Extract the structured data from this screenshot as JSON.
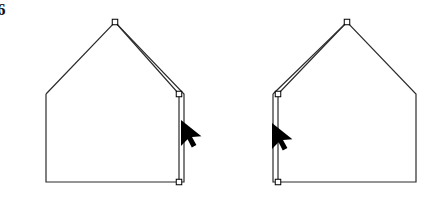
{
  "figure": {
    "corner_label": "6",
    "background_color": "#ffffff",
    "stroke_color": "#2b2b2b",
    "handle_fill": "#ffffff",
    "handle_stroke": "#000000",
    "cursor_color": "#000000",
    "width": 445,
    "height": 206
  },
  "shapes": {
    "left_house": {
      "name": "left-house-polygon",
      "outline_points": "46,94 46,182 184,182 184,94 115,22 46,94",
      "apex": {
        "x": 115,
        "y": 22
      },
      "left_eave": {
        "x": 46,
        "y": 94
      },
      "right_eave": {
        "x": 184,
        "y": 94
      },
      "bottom_left": {
        "x": 46,
        "y": 182
      },
      "bottom_right": {
        "x": 184,
        "y": 182
      },
      "dragged_edge_points": "115,22 179,94 179,182",
      "handles": [
        {
          "name": "vertex-handle-apex",
          "x": 115,
          "y": 22
        },
        {
          "name": "vertex-handle-right-eave",
          "x": 179,
          "y": 94
        },
        {
          "name": "vertex-handle-bottom-right",
          "x": 179,
          "y": 182
        }
      ],
      "cursor": {
        "name": "arrow-cursor-left",
        "x": 181,
        "y": 120
      }
    },
    "right_house": {
      "name": "right-house-polygon",
      "outline_points": "273,94 273,182 416,182 416,94 347,22 273,94",
      "apex": {
        "x": 347,
        "y": 22
      },
      "left_eave": {
        "x": 273,
        "y": 94
      },
      "right_eave": {
        "x": 416,
        "y": 94
      },
      "bottom_left": {
        "x": 273,
        "y": 182
      },
      "bottom_right": {
        "x": 416,
        "y": 182
      },
      "dragged_edge_points": "347,22 278,94 278,182",
      "handles": [
        {
          "name": "vertex-handle-apex",
          "x": 347,
          "y": 22
        },
        {
          "name": "vertex-handle-left-eave",
          "x": 278,
          "y": 94
        },
        {
          "name": "vertex-handle-bottom-left",
          "x": 278,
          "y": 182
        }
      ],
      "cursor": {
        "name": "arrow-cursor-right",
        "x": 272,
        "y": 123
      }
    }
  }
}
